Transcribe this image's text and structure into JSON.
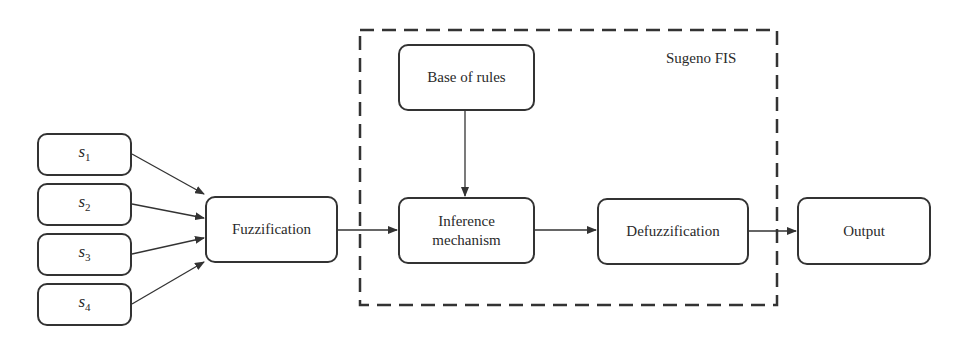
{
  "diagram": {
    "inputs": [
      {
        "name": "s",
        "sub": "1"
      },
      {
        "name": "s",
        "sub": "2"
      },
      {
        "name": "s",
        "sub": "3"
      },
      {
        "name": "s",
        "sub": "4"
      }
    ],
    "fuzzification": "Fuzzification",
    "group_label": "Sugeno FIS",
    "base_of_rules": "Base of rules",
    "inference": [
      "Inference",
      "mechanism"
    ],
    "defuzzification": "Defuzzification",
    "output": "Output",
    "colors": {
      "stroke": "#333333",
      "background": "#ffffff",
      "text": "#2a2a2a"
    }
  }
}
